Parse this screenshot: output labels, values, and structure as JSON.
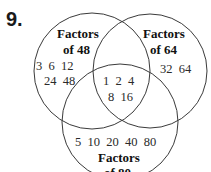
{
  "problem_number": "9.",
  "sets": [
    {
      "label_line1": "Factors",
      "label_line2": "of 48",
      "only_row1": "3  6  12",
      "only_row2": "24  48"
    },
    {
      "label_line1": "Factors",
      "label_line2": "of 64",
      "only_row1": "32  64"
    },
    {
      "label_line1": "Factors",
      "label_line2": "of 80",
      "only_row1": "5  10  20  40  80"
    }
  ],
  "intersection_all": {
    "row1": "1  2  4",
    "row2": "8  16"
  },
  "colors": {
    "stroke": "#3a3a3a",
    "text": "#2a2a2a"
  }
}
